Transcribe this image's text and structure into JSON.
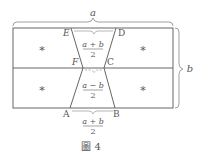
{
  "figure": {
    "caption": "圖 4",
    "dimension_labels": {
      "width": "a",
      "height": "b"
    },
    "vertices": {
      "A": "A",
      "B": "B",
      "C": "C",
      "D": "D",
      "E": "E",
      "F": "F"
    },
    "fractions": {
      "top": {
        "num": "a + b",
        "den": "2"
      },
      "middle": {
        "num": "a − b",
        "den": "2"
      },
      "bottom": {
        "num": "a + b",
        "den": "2"
      }
    },
    "region_marks": [
      "*",
      "*",
      "*",
      "*"
    ]
  }
}
